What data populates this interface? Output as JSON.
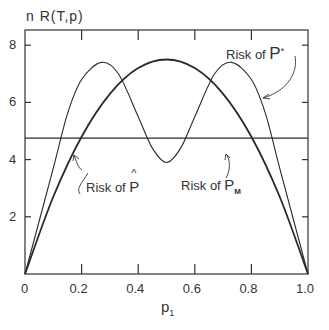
{
  "chart_data": {
    "type": "line",
    "title": "",
    "ylabel": "n R(T,p)",
    "xlabel": "p1",
    "xlim": [
      0,
      1.0
    ],
    "ylim": [
      0,
      8.5
    ],
    "x_ticks": [
      "0",
      "0.2",
      "0.4",
      "0.6",
      "0.8",
      "1.0"
    ],
    "y_ticks": [
      "2",
      "4",
      "6",
      "8"
    ],
    "grid": false,
    "series": [
      {
        "name": "Risk of P̂",
        "x": [
          0,
          0.1,
          0.2,
          0.3,
          0.4,
          0.5,
          0.6,
          0.7,
          0.8,
          0.9,
          1.0
        ],
        "values": [
          0,
          2.7,
          4.8,
          6.3,
          7.2,
          7.5,
          7.2,
          6.3,
          4.8,
          2.7,
          0
        ]
      },
      {
        "name": "Risk of P*",
        "x": [
          0,
          0.1,
          0.15,
          0.2,
          0.27,
          0.33,
          0.4,
          0.45,
          0.5,
          0.55,
          0.6,
          0.67,
          0.73,
          0.8,
          0.85,
          0.9,
          1.0
        ],
        "values": [
          0,
          3.7,
          5.6,
          6.8,
          7.4,
          7.0,
          5.5,
          4.4,
          3.9,
          4.4,
          5.5,
          7.0,
          7.4,
          6.8,
          5.6,
          3.7,
          0
        ]
      },
      {
        "name": "Risk of P_M",
        "x": [
          0,
          1.0
        ],
        "values": [
          4.75,
          4.75
        ]
      }
    ],
    "annotations": [
      "Risk of P*",
      "Risk of P̂",
      "Risk of P_M"
    ]
  },
  "labels": {
    "y_axis": "n R(T,p)",
    "x_axis_main": "p",
    "x_axis_sub": "1",
    "risk_pstar_text": "Risk of ",
    "risk_pstar_sym": "P",
    "risk_pstar_sup": "*",
    "risk_phat_text": "Risk of ",
    "risk_phat_sym": "P",
    "risk_phat_hat": "^",
    "risk_pm_text": "Risk of ",
    "risk_pm_sym": "P",
    "risk_pm_sub": "M"
  }
}
